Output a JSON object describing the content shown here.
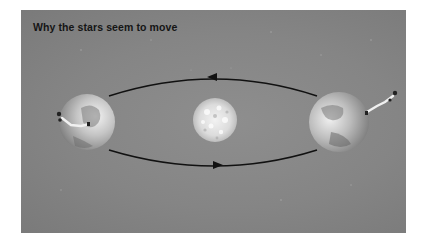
{
  "figure": {
    "title": "Why the stars seem to move",
    "elements": {
      "sun": {
        "label": "Sun",
        "cx": 194,
        "cy": 110,
        "r": 22
      },
      "earth_left": {
        "label": "Earth (one side of orbit)",
        "cx": 66,
        "cy": 112,
        "r": 28
      },
      "earth_right": {
        "label": "Earth (opposite side of orbit)",
        "cx": 318,
        "cy": 112,
        "r": 30
      },
      "observer_left": {
        "label": "Observer on Earth"
      },
      "observer_right": {
        "label": "Observer on Earth"
      },
      "orbit": {
        "label": "Earth's orbit",
        "direction": "counter-clockwise"
      },
      "arrow_top": {
        "direction": "left"
      },
      "arrow_bottom": {
        "direction": "right"
      }
    },
    "colors": {
      "background": "#858585",
      "orbit_line": "#111111",
      "title_text": "#151515"
    }
  }
}
